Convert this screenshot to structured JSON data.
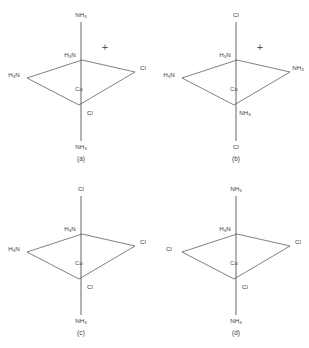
{
  "figure": {
    "background_color": "#ffffff",
    "line_color": "#4a4a4a",
    "text_color": "#3a3a3a"
  },
  "geometry": {
    "note": "Parallelogram equatorial plane with axial bonds drawn vertically through the metal centre",
    "plane_vertices": {
      "back": [
        82,
        60
      ],
      "right": [
        135,
        72
      ],
      "front": [
        79,
        105
      ],
      "left": [
        27,
        78
      ]
    },
    "metal_center": [
      81,
      82
    ],
    "axial_top_end": [
      81,
      22
    ],
    "axial_bottom_end": [
      81,
      141
    ]
  },
  "structures": [
    {
      "id": "a",
      "caption": "(a)",
      "charge": "+",
      "has_charge": true,
      "metal": "Co",
      "ligands": {
        "axial_top": {
          "formula": "NH",
          "sub": "3",
          "order": "normal"
        },
        "axial_bottom": {
          "formula": "NH",
          "sub": "3",
          "order": "normal"
        },
        "equatorial_back": {
          "formula": "H N",
          "sub": "3",
          "order": "reversed"
        },
        "equatorial_left": {
          "formula": "H N",
          "sub": "3",
          "order": "reversed"
        },
        "equatorial_right": {
          "formula": "Cl",
          "sub": "",
          "order": "plain"
        },
        "equatorial_front": {
          "formula": "Cl",
          "sub": "",
          "order": "plain"
        }
      }
    },
    {
      "id": "b",
      "caption": "(b)",
      "charge": "+",
      "has_charge": true,
      "metal": "Co",
      "ligands": {
        "axial_top": {
          "formula": "Cl",
          "sub": "",
          "order": "plain"
        },
        "axial_bottom": {
          "formula": "Cl",
          "sub": "",
          "order": "plain"
        },
        "equatorial_back": {
          "formula": "H N",
          "sub": "3",
          "order": "reversed"
        },
        "equatorial_left": {
          "formula": "H N",
          "sub": "3",
          "order": "reversed"
        },
        "equatorial_right": {
          "formula": "NH",
          "sub": "3",
          "order": "normal"
        },
        "equatorial_front": {
          "formula": "NH",
          "sub": "3",
          "order": "normal"
        }
      }
    },
    {
      "id": "c",
      "caption": "(c)",
      "charge": "",
      "has_charge": false,
      "metal": "Co",
      "ligands": {
        "axial_top": {
          "formula": "Cl",
          "sub": "",
          "order": "plain"
        },
        "axial_bottom": {
          "formula": "NH",
          "sub": "3",
          "order": "normal"
        },
        "equatorial_back": {
          "formula": "H N",
          "sub": "3",
          "order": "reversed"
        },
        "equatorial_left": {
          "formula": "H N",
          "sub": "3",
          "order": "reversed"
        },
        "equatorial_right": {
          "formula": "Cl",
          "sub": "",
          "order": "plain"
        },
        "equatorial_front": {
          "formula": "Cl",
          "sub": "",
          "order": "plain"
        }
      }
    },
    {
      "id": "d",
      "caption": "(d)",
      "charge": "",
      "has_charge": false,
      "metal": "Co",
      "ligands": {
        "axial_top": {
          "formula": "NH",
          "sub": "3",
          "order": "normal"
        },
        "axial_bottom": {
          "formula": "NH",
          "sub": "3",
          "order": "normal"
        },
        "equatorial_back": {
          "formula": "H N",
          "sub": "3",
          "order": "reversed"
        },
        "equatorial_left": {
          "formula": "Cl",
          "sub": "",
          "order": "plain"
        },
        "equatorial_right": {
          "formula": "Cl",
          "sub": "",
          "order": "plain"
        },
        "equatorial_front": {
          "formula": "Cl",
          "sub": "",
          "order": "plain"
        }
      }
    }
  ]
}
